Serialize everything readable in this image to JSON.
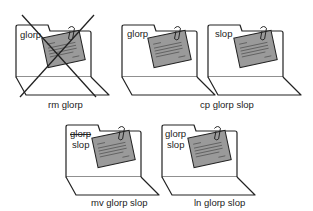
{
  "colors": {
    "line": "#222222",
    "paper": "#9a9a9a",
    "background": "#ffffff"
  },
  "panels": [
    {
      "id": "rm",
      "caption": "rm glorp",
      "folders": [
        {
          "labels": [
            "glorp"
          ],
          "crossed_out": true
        }
      ]
    },
    {
      "id": "cp",
      "caption": "cp glorp slop",
      "folders": [
        {
          "labels": [
            "glorp"
          ]
        },
        {
          "labels": [
            "slop"
          ]
        }
      ]
    },
    {
      "id": "mv",
      "caption": "mv glorp slop",
      "folders": [
        {
          "labels": [
            "glorp",
            "slop"
          ],
          "struck_label": "glorp"
        }
      ]
    },
    {
      "id": "ln",
      "caption": "ln glorp slop",
      "folders": [
        {
          "labels": [
            "glorp",
            "slop"
          ]
        }
      ]
    }
  ]
}
